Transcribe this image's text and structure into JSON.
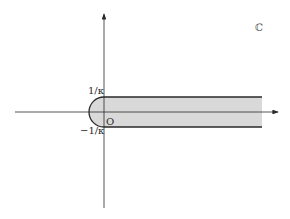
{
  "diagram": {
    "plane_label": "ℂ",
    "origin_label": "O",
    "upper_label": "1/κ",
    "lower_label": "−1/κ",
    "region_fill": "#d9d9d9",
    "stroke_color": "#2a2a2a"
  }
}
